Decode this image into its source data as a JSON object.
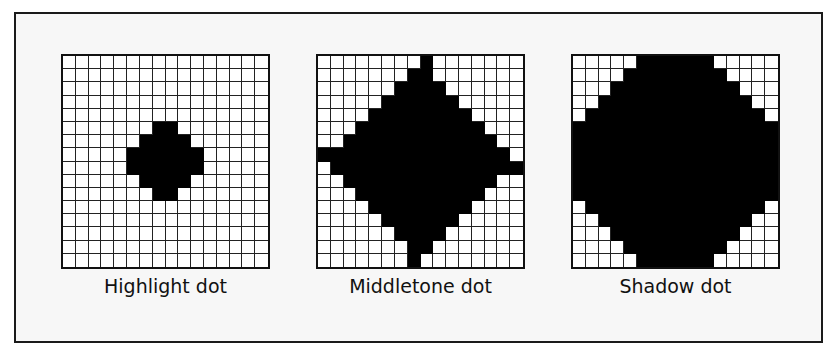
{
  "figure": {
    "grid_size": 16,
    "ink_color": "#000000",
    "paper_color": "#ffffff",
    "panels": [
      {
        "id": "highlight",
        "label": "Highlight dot",
        "filled_rows": {
          "5": [
            7,
            8
          ],
          "6": [
            6,
            9
          ],
          "7": [
            5,
            10
          ],
          "8": [
            5,
            10
          ],
          "9": [
            6,
            9
          ],
          "10": [
            7,
            8
          ]
        }
      },
      {
        "id": "middletone",
        "label": "Middletone dot",
        "filled_rows": {
          "0": [
            8,
            8
          ],
          "1": [
            7,
            8
          ],
          "2": [
            6,
            9
          ],
          "3": [
            5,
            10
          ],
          "4": [
            4,
            11
          ],
          "5": [
            3,
            12
          ],
          "6": [
            2,
            13
          ],
          "7": [
            0,
            14
          ],
          "8": [
            1,
            15
          ],
          "9": [
            2,
            13
          ],
          "10": [
            3,
            12
          ],
          "11": [
            4,
            11
          ],
          "12": [
            5,
            10
          ],
          "13": [
            6,
            9
          ],
          "14": [
            7,
            8
          ],
          "15": [
            7,
            7
          ]
        }
      },
      {
        "id": "shadow",
        "label": "Shadow dot",
        "filled_rows": {
          "0": [
            5,
            10
          ],
          "1": [
            4,
            11
          ],
          "2": [
            3,
            12
          ],
          "3": [
            2,
            13
          ],
          "4": [
            1,
            14
          ],
          "5": [
            0,
            15
          ],
          "6": [
            0,
            15
          ],
          "7": [
            0,
            15
          ],
          "8": [
            0,
            15
          ],
          "9": [
            0,
            15
          ],
          "10": [
            0,
            15
          ],
          "11": [
            1,
            14
          ],
          "12": [
            2,
            13
          ],
          "13": [
            3,
            12
          ],
          "14": [
            4,
            11
          ],
          "15": [
            5,
            10
          ]
        }
      }
    ]
  }
}
